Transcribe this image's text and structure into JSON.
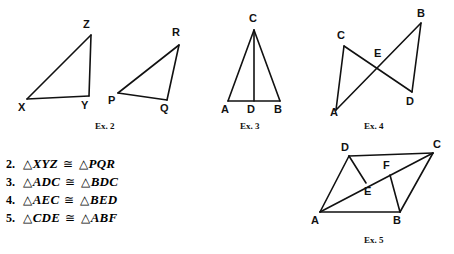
{
  "page": {
    "background_color": "#ffffff",
    "ink_color": "#111111",
    "width": 454,
    "height": 254
  },
  "figures": [
    {
      "id": "fig-ex2-xyz",
      "caption": "Ex. 2",
      "caption_pos": {
        "x": 103,
        "y": 122
      },
      "shape": "triangle",
      "vertices": [
        {
          "name": "X",
          "x": 27,
          "y": 99,
          "label_x": 18,
          "label_y": 102
        },
        {
          "name": "Y",
          "x": 89,
          "y": 96,
          "label_x": 81,
          "label_y": 100
        },
        {
          "name": "Z",
          "x": 91,
          "y": 35,
          "label_x": 83,
          "label_y": 19
        }
      ],
      "edges": [
        [
          "X",
          "Y"
        ],
        [
          "Y",
          "Z"
        ],
        [
          "Z",
          "X"
        ]
      ]
    },
    {
      "id": "fig-ex2-pqr",
      "caption": "",
      "shape": "triangle",
      "vertices": [
        {
          "name": "P",
          "x": 118,
          "y": 93,
          "label_x": 108,
          "label_y": 95
        },
        {
          "name": "Q",
          "x": 167,
          "y": 100,
          "label_x": 160,
          "label_y": 103
        },
        {
          "name": "R",
          "x": 179,
          "y": 45,
          "label_x": 172,
          "label_y": 27
        }
      ],
      "edges": [
        [
          "P",
          "Q"
        ],
        [
          "Q",
          "R"
        ],
        [
          "R",
          "P"
        ]
      ]
    },
    {
      "id": "fig-ex3",
      "caption": "Ex. 3",
      "caption_pos": {
        "x": 248,
        "y": 122
      },
      "shape": "isosceles-triangle-with-altitude",
      "vertices": [
        {
          "name": "A",
          "x": 228,
          "y": 101,
          "label_x": 221,
          "label_y": 104
        },
        {
          "name": "D",
          "x": 254,
          "y": 101,
          "label_x": 247,
          "label_y": 104
        },
        {
          "name": "B",
          "x": 280,
          "y": 101,
          "label_x": 274,
          "label_y": 104
        },
        {
          "name": "C",
          "x": 254,
          "y": 30,
          "label_x": 248,
          "label_y": 13
        }
      ],
      "edges": [
        [
          "A",
          "B"
        ],
        [
          "A",
          "C"
        ],
        [
          "C",
          "B"
        ],
        [
          "C",
          "D"
        ]
      ]
    },
    {
      "id": "fig-ex4",
      "caption": "Ex. 4",
      "caption_pos": {
        "x": 372,
        "y": 122
      },
      "shape": "bowtie-triangles",
      "vertices": [
        {
          "name": "A",
          "x": 336,
          "y": 110,
          "label_x": 330,
          "label_y": 107
        },
        {
          "name": "C",
          "x": 344,
          "y": 46,
          "label_x": 337,
          "label_y": 30
        },
        {
          "name": "E",
          "x": 379,
          "y": 65,
          "label_x": 374,
          "label_y": 48
        },
        {
          "name": "B",
          "x": 421,
          "y": 23,
          "label_x": 417,
          "label_y": 8
        },
        {
          "name": "D",
          "x": 412,
          "y": 92,
          "label_x": 406,
          "label_y": 96
        }
      ],
      "edges": [
        [
          "A",
          "C"
        ],
        [
          "C",
          "D"
        ],
        [
          "A",
          "B"
        ],
        [
          "B",
          "D"
        ]
      ]
    },
    {
      "id": "fig-ex5",
      "caption": "Ex. 5",
      "caption_pos": {
        "x": 372,
        "y": 236
      },
      "shape": "parallelogram-with-cevians",
      "vertices": [
        {
          "name": "A",
          "x": 320,
          "y": 212,
          "label_x": 312,
          "label_y": 215
        },
        {
          "name": "B",
          "x": 400,
          "y": 212,
          "label_x": 393,
          "label_y": 215
        },
        {
          "name": "C",
          "x": 433,
          "y": 153,
          "label_x": 433,
          "label_y": 140
        },
        {
          "name": "D",
          "x": 349,
          "y": 156,
          "label_x": 341,
          "label_y": 142
        },
        {
          "name": "E",
          "x": 366,
          "y": 183,
          "label_x": 364,
          "label_y": 186
        },
        {
          "name": "F",
          "x": 390,
          "y": 175,
          "label_x": 383,
          "label_y": 161
        }
      ],
      "edges": [
        [
          "D",
          "C"
        ],
        [
          "A",
          "B"
        ],
        [
          "A",
          "D"
        ],
        [
          "B",
          "C"
        ],
        [
          "A",
          "C"
        ],
        [
          "D",
          "E"
        ],
        [
          "F",
          "B"
        ]
      ]
    }
  ],
  "congruence_list": {
    "triangle_glyph": "△",
    "congruent_sign": "≅",
    "items": [
      {
        "number": "2.",
        "left": "XYZ",
        "right": "PQR"
      },
      {
        "number": "3.",
        "left": "ADC",
        "right": "BDC"
      },
      {
        "number": "4.",
        "left": "AEC",
        "right": "BED"
      },
      {
        "number": "5.",
        "left": "CDE",
        "right": "ABF"
      }
    ]
  }
}
